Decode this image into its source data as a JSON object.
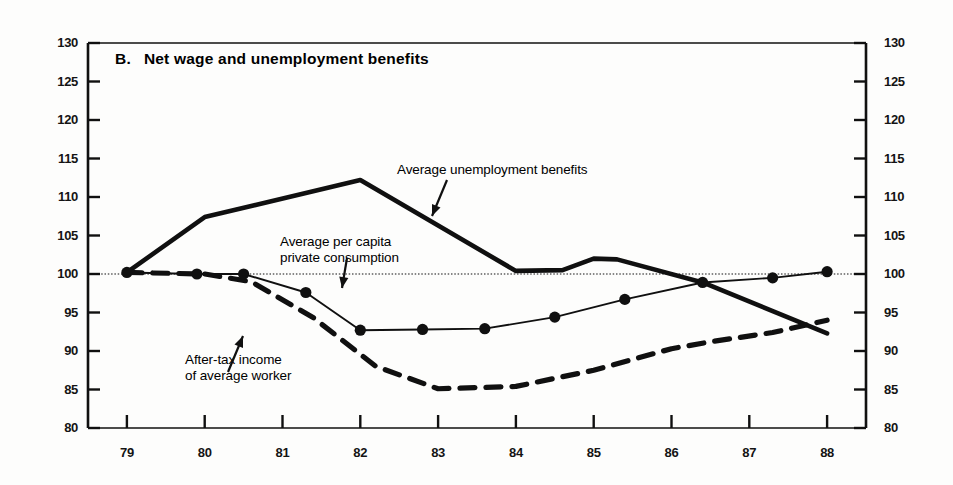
{
  "chart_data": {
    "type": "line",
    "title_prefix": "B.",
    "title_text": "Net wage and unemployment benefits",
    "xlabel": "",
    "ylabel": "",
    "index_base": 100,
    "grid": false,
    "baseline_value": 100,
    "legend_position": "inline-annotations",
    "xlim": [
      78.5,
      88.5
    ],
    "ylim": [
      80,
      130
    ],
    "yticks": [
      80,
      85,
      90,
      95,
      100,
      105,
      110,
      115,
      120,
      125,
      130
    ],
    "ytick_labels": [
      "80",
      "85",
      "90",
      "95",
      "100",
      "105",
      "110",
      "115",
      "120",
      "125",
      "130"
    ],
    "y_axis_right_mirrored": true,
    "xticks": [
      79,
      80,
      81,
      82,
      83,
      84,
      85,
      86,
      87,
      88
    ],
    "xtick_labels": [
      "79",
      "80",
      "81",
      "82",
      "83",
      "84",
      "85",
      "86",
      "87",
      "88"
    ],
    "series": [
      {
        "name": "Average unemployment benefits",
        "style": "solid-thick",
        "markers": false,
        "x": [
          79.0,
          80.0,
          82.0,
          84.0,
          84.6,
          85.0,
          85.3,
          86.4,
          88.0
        ],
        "values": [
          100.2,
          107.4,
          112.2,
          100.4,
          100.5,
          102.0,
          101.9,
          98.9,
          92.3
        ]
      },
      {
        "name": "Average per capita private consumption",
        "style": "solid-thin",
        "markers": true,
        "x": [
          79.0,
          79.9,
          80.5,
          81.3,
          82.0,
          82.8,
          83.6,
          84.5,
          85.4,
          86.4,
          87.3,
          88.0
        ],
        "values": [
          100.2,
          100.0,
          100.0,
          97.6,
          92.7,
          92.8,
          92.9,
          94.4,
          96.7,
          98.9,
          99.5,
          100.3
        ]
      },
      {
        "name": "After-tax income of average worker",
        "style": "dashed-thick",
        "markers": false,
        "x": [
          79.0,
          80.0,
          80.6,
          81.4,
          82.2,
          83.0,
          84.0,
          85.0,
          86.0,
          86.5,
          87.3,
          88.0
        ],
        "values": [
          100.2,
          100.0,
          99.0,
          94.3,
          88.0,
          85.1,
          85.4,
          87.5,
          90.3,
          91.2,
          92.4,
          94.0
        ]
      }
    ],
    "annotations": [
      {
        "name": "average-unemployment-benefits",
        "text": "Average unemployment benefits"
      },
      {
        "name": "average-per-capita-private-consumption",
        "line1": "Average per capita",
        "line2": "private consumption"
      },
      {
        "name": "after-tax-income-of-average-worker",
        "line1": "After-tax income",
        "line2": "of average worker"
      }
    ],
    "colors": {
      "ink": "#101010",
      "background": "#fdfdfc"
    }
  }
}
